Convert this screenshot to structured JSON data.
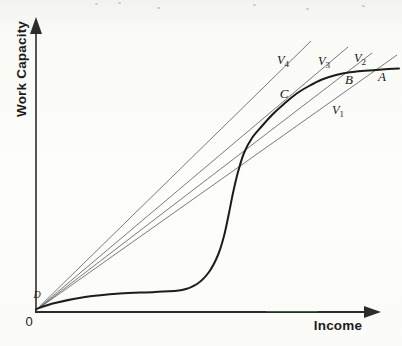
{
  "figure": {
    "axis_color": "#2c2c2c",
    "ray_color": "#6a6a6a",
    "curve_color": "#1c1c1c",
    "scan_artifact_green": "#4a8c4a",
    "speck_color": "#c9c9c3"
  },
  "chart_data": {
    "type": "line",
    "xlabel": "Income",
    "ylabel": "Work Capacity",
    "numeric_scale": false,
    "origin_label": "0",
    "axes_px": {
      "y": {
        "from": [
          36,
          313
        ],
        "to": [
          36,
          31
        ],
        "arrow": [
          [
            36,
            17
          ],
          [
            30,
            34
          ],
          [
            42,
            34
          ]
        ]
      },
      "x": {
        "from": [
          35,
          312
        ],
        "to": [
          366,
          312
        ],
        "arrow": [
          [
            381,
            312
          ],
          [
            364,
            306
          ],
          [
            364,
            318
          ]
        ]
      },
      "green_artifact": {
        "from": [
          266,
          311.5
        ],
        "to": [
          318,
          311.5
        ]
      }
    },
    "work_capacity_curve": {
      "description": "Thick S-shaped curve: starts at D just above the origin, nearly flat at low income, rises steeply at middle income, then saturates crossing rays V3, V2, V1 at points C, B, A",
      "points_px": [
        [
          36,
          309
        ],
        [
          55,
          303
        ],
        [
          85,
          297
        ],
        [
          120,
          293.5
        ],
        [
          155,
          292
        ],
        [
          182,
          290
        ],
        [
          197,
          284
        ],
        [
          209,
          272
        ],
        [
          218,
          255
        ],
        [
          224,
          236
        ],
        [
          229,
          213
        ],
        [
          233,
          193
        ],
        [
          238,
          172
        ],
        [
          244,
          153
        ],
        [
          252,
          138
        ],
        [
          262,
          126
        ],
        [
          273,
          114
        ],
        [
          284,
          104
        ],
        [
          296,
          94
        ],
        [
          309,
          86
        ],
        [
          322,
          79.5
        ],
        [
          336,
          75
        ],
        [
          350,
          72.3
        ],
        [
          365,
          70.8
        ],
        [
          382,
          69.5
        ],
        [
          399,
          68.5
        ]
      ]
    },
    "rays": [
      {
        "name": "V4",
        "base": "V",
        "sub": "4",
        "from_px": [
          35,
          311
        ],
        "to_px": [
          311,
          41
        ],
        "label_px": [
          283,
          60
        ]
      },
      {
        "name": "V3",
        "base": "V",
        "sub": "3",
        "from_px": [
          35,
          311
        ],
        "to_px": [
          348,
          47
        ],
        "label_px": [
          324,
          61
        ]
      },
      {
        "name": "V2",
        "base": "V",
        "sub": "2",
        "from_px": [
          35,
          311
        ],
        "to_px": [
          372,
          53
        ],
        "label_px": [
          360,
          58
        ]
      },
      {
        "name": "V1",
        "base": "V",
        "sub": "1",
        "from_px": [
          35,
          311
        ],
        "to_px": [
          397,
          55
        ],
        "label_px": [
          338,
          110
        ]
      }
    ],
    "points": [
      {
        "label": "A",
        "px": [
          382,
          76
        ]
      },
      {
        "label": "B",
        "px": [
          349,
          79
        ]
      },
      {
        "label": "C",
        "px": [
          284,
          93
        ]
      },
      {
        "label": "D",
        "px": [
          37,
          295
        ]
      }
    ],
    "scan_specks_px": [
      [
        95,
        3
      ],
      [
        157,
        7
      ],
      [
        253,
        4
      ],
      [
        306,
        8
      ],
      [
        362,
        5
      ],
      [
        118,
        2
      ]
    ]
  }
}
